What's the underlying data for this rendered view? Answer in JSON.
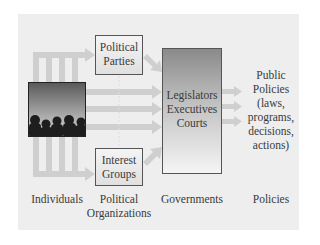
{
  "diagram": {
    "nodes": {
      "individuals_image": "crowd-silhouette",
      "political_parties": [
        "Political",
        "Parties"
      ],
      "interest_groups": [
        "Interest",
        "Groups"
      ],
      "government": [
        "Legislators",
        "Executives",
        "Courts"
      ],
      "public_policies": [
        "Public",
        "Policies",
        "(laws,",
        "programs,",
        "decisions,",
        "actions)"
      ]
    },
    "column_labels": {
      "individuals": "Individuals",
      "political_organizations": [
        "Political",
        "Organizations"
      ],
      "governments": "Governments",
      "policies": "Policies"
    },
    "colors": {
      "background_panel": "#eeeeee",
      "arrow": "#cfcfcf",
      "box_border": "#555555",
      "text": "#3a3a3a"
    }
  }
}
